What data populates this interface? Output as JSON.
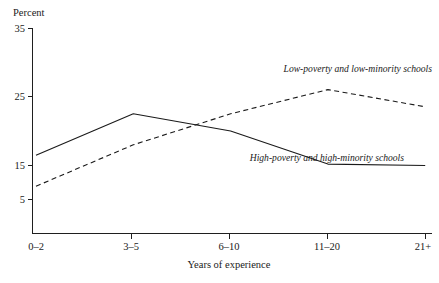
{
  "chart_data": {
    "type": "line",
    "title": "",
    "xlabel": "Years of experience",
    "ylabel": "Percent",
    "categories": [
      "0–2",
      "3–5",
      "6–10",
      "11–20",
      "21+"
    ],
    "yticks": [
      5,
      15,
      25,
      35
    ],
    "ylim": [
      0,
      35
    ],
    "grid": false,
    "legend_position": "inline-annotations",
    "series": [
      {
        "name": "High-poverty and high-minority schools",
        "style": "solid",
        "values": [
          16.5,
          22.5,
          20.0,
          15.2,
          15.0
        ]
      },
      {
        "name": "Low-poverty and low-minority schools",
        "style": "dashed",
        "values": [
          12.0,
          18.0,
          22.5,
          26.0,
          23.5
        ]
      }
    ],
    "annotations": [
      {
        "text": "Low-poverty and low-minority schools",
        "series": "Low-poverty and low-minority schools"
      },
      {
        "text": "High-poverty and high-minority schools",
        "series": "High-poverty and high-minority schools"
      }
    ]
  },
  "axes": {
    "y_axis_name": "Percent",
    "y_tick_labels": [
      "35",
      "25",
      "15",
      "5"
    ],
    "x_tick_labels": [
      "0–2",
      "3–5",
      "6–10",
      "11–20",
      "21+"
    ],
    "x_axis_title": "Years of experience"
  },
  "labels": {
    "low_poverty": "Low-poverty and low-minority schools",
    "high_poverty": "High-poverty and high-minority schools"
  },
  "colors": {
    "ink": "#1a1a1a",
    "background": "#ffffff"
  }
}
